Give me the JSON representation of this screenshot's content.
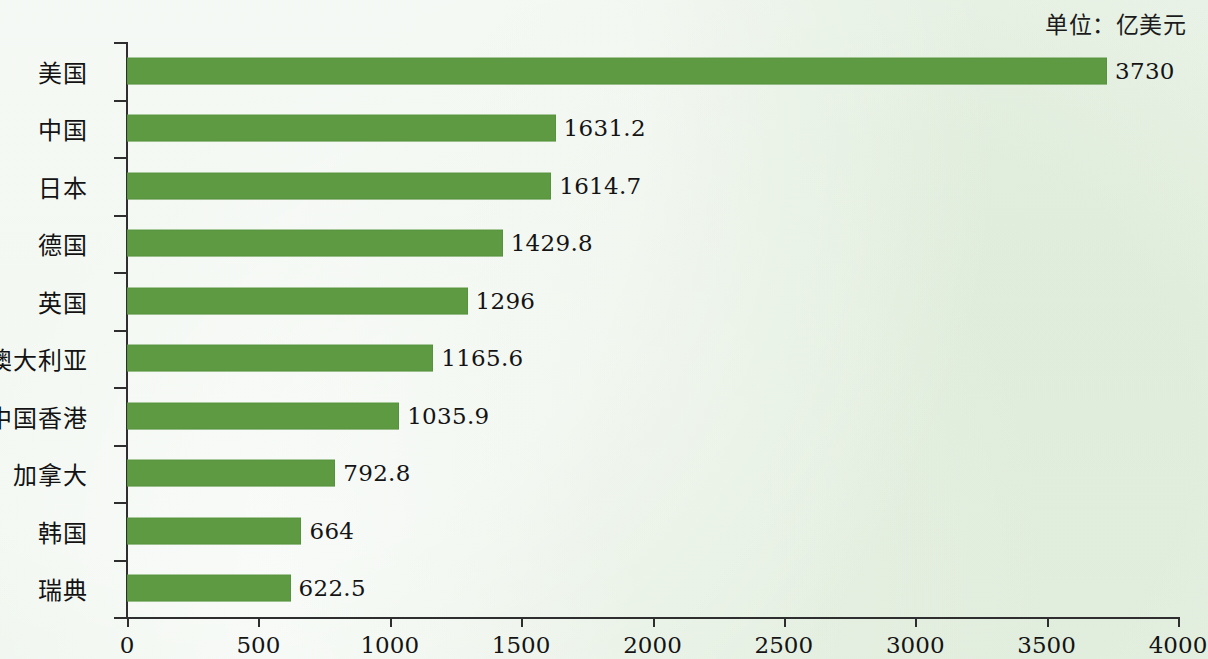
{
  "unit_note": "单位：亿美元",
  "chart_data": {
    "type": "bar",
    "orientation": "horizontal",
    "title": "",
    "subtitle": "",
    "xlabel": "",
    "ylabel": "",
    "unit": "单位：亿美元",
    "categories": [
      "美国",
      "中国",
      "日本",
      "德国",
      "英国",
      "澳大利亚",
      "中国香港",
      "加拿大",
      "韩国",
      "瑞典"
    ],
    "values": [
      3730,
      1631.2,
      1614.7,
      1429.8,
      1296,
      1165.6,
      1035.9,
      792.8,
      664,
      622.5
    ],
    "value_labels": [
      "3730",
      "1631.2",
      "1614.7",
      "1429.8",
      "1296",
      "1165.6",
      "1035.9",
      "792.8",
      "664",
      "622.5"
    ],
    "xlim": [
      0,
      4000
    ],
    "xticks": [
      0,
      500,
      1000,
      1500,
      2000,
      2500,
      3000,
      3500,
      4000
    ],
    "xtick_labels": [
      "0",
      "500",
      "1000",
      "1500",
      "2000",
      "2500",
      "3000",
      "3500",
      "4000"
    ],
    "grid": false,
    "legend": null,
    "bar_color": "#5d9a42",
    "background_color": "#eaf3e8",
    "axis_color": "#2e2e2e",
    "text_color": "#141414"
  }
}
